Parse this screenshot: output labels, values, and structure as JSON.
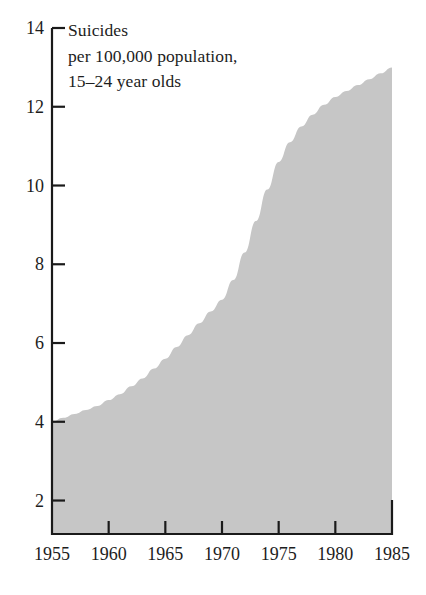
{
  "chart_data": {
    "type": "area",
    "title": "Suicides\nper 100,000  population,\n15–24 year olds",
    "title_lines": [
      "Suicides",
      "per 100,000  population,",
      "15–24 year olds"
    ],
    "xlabel": "",
    "ylabel": "",
    "xlim": [
      1955,
      1985
    ],
    "ylim": [
      1.15,
      14
    ],
    "xticks": [
      1955,
      1960,
      1965,
      1970,
      1975,
      1980,
      1985
    ],
    "xtick_labels": [
      "1955",
      "1960",
      "1965",
      "1970",
      "1975",
      "1980",
      "1985"
    ],
    "yticks": [
      2,
      4,
      6,
      8,
      10,
      12,
      14
    ],
    "ytick_labels": [
      "2",
      "4",
      "6",
      "8",
      "10",
      "12",
      "14"
    ],
    "grid": false,
    "legend": null,
    "fill_color": "#c6c6c6",
    "axis_color": "#1a1a1a",
    "baseline_value": 1.15,
    "x": [
      1955,
      1956,
      1957,
      1958,
      1959,
      1960,
      1961,
      1962,
      1963,
      1964,
      1965,
      1966,
      1967,
      1968,
      1969,
      1970,
      1971,
      1972,
      1973,
      1974,
      1975,
      1976,
      1977,
      1978,
      1979,
      1980,
      1981,
      1982,
      1983,
      1984,
      1985
    ],
    "values": [
      4.0,
      4.1,
      4.2,
      4.3,
      4.4,
      4.55,
      4.7,
      4.9,
      5.1,
      5.35,
      5.6,
      5.9,
      6.2,
      6.5,
      6.8,
      7.1,
      7.6,
      8.3,
      9.1,
      9.9,
      10.6,
      11.1,
      11.5,
      11.8,
      12.05,
      12.25,
      12.4,
      12.55,
      12.7,
      12.85,
      13.0
    ],
    "series": [
      {
        "name": "Suicides per 100,000 population, 15–24 year olds",
        "values": [
          4.0,
          4.1,
          4.2,
          4.3,
          4.4,
          4.55,
          4.7,
          4.9,
          5.1,
          5.35,
          5.6,
          5.9,
          6.2,
          6.5,
          6.8,
          7.1,
          7.6,
          8.3,
          9.1,
          9.9,
          10.6,
          11.1,
          11.5,
          11.8,
          12.05,
          12.25,
          12.4,
          12.55,
          12.7,
          12.85,
          13.0
        ]
      }
    ],
    "annotations": []
  }
}
